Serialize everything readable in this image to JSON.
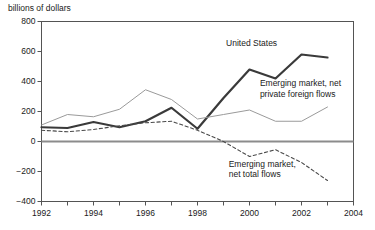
{
  "chart_data": {
    "type": "line",
    "title": "billions of dollars",
    "xlabel": "",
    "ylabel": "billions of dollars",
    "xlim": [
      1992,
      2004
    ],
    "ylim": [
      -400,
      800
    ],
    "yticks": [
      800,
      600,
      400,
      200,
      0,
      -200,
      -400
    ],
    "ytick_labels": [
      "800",
      "600",
      "400",
      "200",
      "0",
      "−200",
      "−400"
    ],
    "xticks": [
      1992,
      1994,
      1996,
      1998,
      2000,
      2002,
      2004
    ],
    "xtick_labels": [
      "1992",
      "1994",
      "1996",
      "1998",
      "2000",
      "2002",
      "2004"
    ],
    "xticks_minor": [
      1993,
      1995,
      1997,
      1999,
      2001,
      2003
    ],
    "grid": false,
    "legend": "inline-annotations",
    "zero_line": true,
    "x": [
      1992,
      1993,
      1994,
      1995,
      1996,
      1997,
      1998,
      1999,
      2000,
      2001,
      2002,
      2003
    ],
    "series": [
      {
        "name": "United States",
        "style": "solid-thick",
        "color": "#3a3a3a",
        "values": [
          95,
          90,
          130,
          95,
          135,
          225,
          85,
          290,
          480,
          420,
          580,
          560
        ]
      },
      {
        "name": "Emerging market, net private foreign flows",
        "style": "solid-thin",
        "color": "#9a9a9a",
        "values": [
          110,
          180,
          165,
          215,
          345,
          280,
          150,
          180,
          210,
          135,
          135,
          230
        ]
      },
      {
        "name": "Emerging market, net total flows",
        "style": "dashed",
        "color": "#4a4a4a",
        "values": [
          75,
          65,
          80,
          105,
          125,
          135,
          75,
          0,
          -100,
          -55,
          -140,
          -260
        ]
      }
    ],
    "annotations": [
      {
        "text": "United States",
        "x": 1999.1,
        "y": 660
      },
      {
        "text": "Emerging market, net",
        "x": 2000.4,
        "y": 390
      },
      {
        "text": "private foreign flows",
        "x": 2000.4,
        "y": 320
      },
      {
        "text": "Emerging market,",
        "x": 1999.2,
        "y": -150
      },
      {
        "text": "net total flows",
        "x": 1999.2,
        "y": -215
      }
    ]
  }
}
